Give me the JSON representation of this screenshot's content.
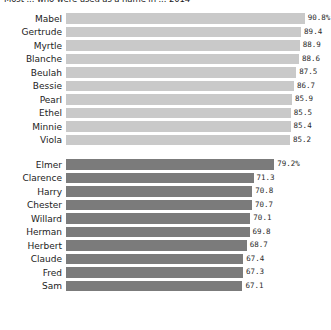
{
  "chart": {
    "title": "Most ... who were used as a name in ... 2014",
    "background_color": "#ffffff",
    "label_color": "#1c1c1c",
    "value_color": "#2a2a2a"
  },
  "colors": {
    "group_top_bar": "#c9c9c9",
    "group_bottom_bar": "#7b7b7b"
  },
  "chart_data": {
    "type": "bar",
    "orientation": "horizontal",
    "title": "Most ... who were used as a name in ... 2014",
    "xlabel": "",
    "ylabel": "",
    "xlim": [
      0,
      100
    ],
    "grid": false,
    "legend": "none",
    "value_suffix_first_row": "%",
    "groups": [
      {
        "name": "group-top",
        "bar_color": "#c9c9c9",
        "categories": [
          "Mabel",
          "Gertrude",
          "Myrtle",
          "Blanche",
          "Beulah",
          "Bessie",
          "Pearl",
          "Ethel",
          "Minnie",
          "Viola"
        ],
        "values": [
          90.8,
          89.4,
          88.9,
          88.6,
          87.5,
          86.7,
          85.9,
          85.5,
          85.4,
          85.2
        ],
        "labels": [
          "90.8%",
          "89.4",
          "88.9",
          "88.6",
          "87.5",
          "86.7",
          "85.9",
          "85.5",
          "85.4",
          "85.2"
        ]
      },
      {
        "name": "group-bottom",
        "bar_color": "#7b7b7b",
        "categories": [
          "Elmer",
          "Clarence",
          "Harry",
          "Chester",
          "Willard",
          "Herman",
          "Herbert",
          "Claude",
          "Fred",
          "Sam"
        ],
        "values": [
          79.2,
          71.3,
          70.8,
          70.7,
          70.1,
          69.8,
          68.7,
          67.4,
          67.3,
          67.1
        ],
        "labels": [
          "79.2%",
          "71.3",
          "70.8",
          "70.7",
          "70.1",
          "69.8",
          "68.7",
          "67.4",
          "67.3",
          "67.1"
        ]
      }
    ]
  }
}
